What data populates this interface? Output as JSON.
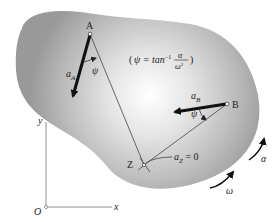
{
  "diagram": {
    "type": "rigid-body acceleration / instantaneous center of zero acceleration",
    "points": {
      "A": {
        "label": "A",
        "vector_label": "a",
        "vector_sub": "A"
      },
      "B": {
        "label": "B",
        "vector_label": "a",
        "vector_sub": "B"
      },
      "Z": {
        "label": "Z",
        "note_main": "a",
        "note_sub": "Z",
        "note_eq": " = 0"
      }
    },
    "angle_label": "ψ",
    "formula": {
      "open": "(",
      "lhs": "ψ = tan",
      "sup": "−1",
      "numerator": "α",
      "denominator": "ω",
      "den_sup": "2",
      "close": ")"
    },
    "axes": {
      "origin": "O",
      "x": "x",
      "y": "y"
    },
    "rotation": {
      "omega": "ω",
      "alpha": "α"
    },
    "colors": {
      "body_edge": "#8a8a8a",
      "body_center": "#ffffff",
      "lines": "#444444",
      "vectors": "#111111",
      "axes": "#777777"
    }
  }
}
